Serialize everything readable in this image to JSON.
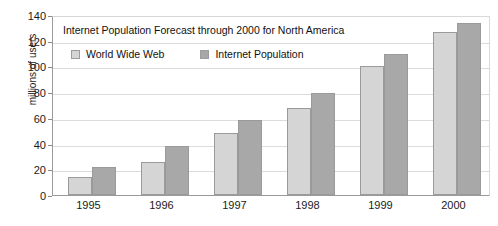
{
  "chart_data": {
    "type": "bar",
    "title": "Internet Population Forecast through 2000 for North America",
    "xlabel": "",
    "ylabel": "millions of users",
    "categories": [
      "1995",
      "1996",
      "1997",
      "1998",
      "1999",
      "2000"
    ],
    "series": [
      {
        "name": "World Wide Web",
        "color": "#d5d5d5",
        "values": [
          14,
          26,
          48,
          68,
          100,
          127
        ]
      },
      {
        "name": "Internet Population",
        "color": "#a8a8a8",
        "values": [
          22,
          38,
          58,
          79,
          110,
          134
        ]
      }
    ],
    "ylim": [
      0,
      140
    ],
    "y_ticks": [
      140,
      120,
      100,
      80,
      60,
      40,
      20,
      0
    ],
    "y_tick_labels": [
      "140",
      "120",
      "100",
      "80",
      "60",
      "40",
      "20",
      "0"
    ],
    "grid": true,
    "legend_position": "top-left-inside"
  }
}
